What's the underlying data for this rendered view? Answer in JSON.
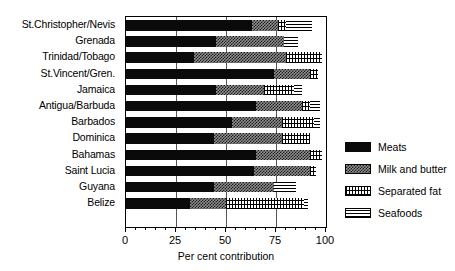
{
  "chart_data": {
    "type": "bar",
    "orientation": "horizontal",
    "stacked": true,
    "title": "",
    "xlabel": "Per cent contribution",
    "ylabel": "",
    "xlim": [
      0,
      100
    ],
    "xticks": [
      0,
      25,
      50,
      75,
      100
    ],
    "xtick_labels": [
      "0",
      "25",
      "50",
      "75",
      "100"
    ],
    "minor_tick_interval": 5,
    "grid": "vertical gridlines at 25, 50, 75",
    "legend_position": "right",
    "categories": [
      "St.Christopher/Nevis",
      "Grenada",
      "Trinidad/Tobago",
      "St.Vincent/Gren.",
      "Jamaica",
      "Antigua/Barbuda",
      "Barbados",
      "Dominica",
      "Bahamas",
      "Saint Lucia",
      "Guyana",
      "Belize"
    ],
    "series": [
      {
        "name": "Meats",
        "fill": "solid-black",
        "color": "#0a0a0a",
        "values": [
          63,
          45,
          34,
          74,
          45,
          65,
          53,
          44,
          65,
          64,
          44,
          32
        ]
      },
      {
        "name": "Milk and butter",
        "fill": "dense-checker",
        "color": "#8f8f8f",
        "values": [
          13,
          34,
          46,
          18,
          24,
          23,
          25,
          34,
          27,
          28,
          30,
          18
        ]
      },
      {
        "name": "Separated fat",
        "fill": "grid-hatch",
        "color": "#ffffff",
        "values": [
          4,
          0,
          18,
          4,
          15,
          4,
          16,
          14,
          6,
          3,
          0,
          39
        ]
      },
      {
        "name": "Seafoods",
        "fill": "horizontal-lines",
        "color": "#ffffff",
        "values": [
          13,
          7,
          0,
          0,
          4,
          5,
          3,
          0,
          0,
          0,
          11,
          2
        ]
      }
    ],
    "totals": [
      93,
      86,
      98,
      96,
      88,
      97,
      97,
      92,
      98,
      95,
      85,
      91
    ],
    "legend_entries": [
      {
        "label": "Meats",
        "fill": "solid-black"
      },
      {
        "label": "Milk and butter",
        "fill": "dense-checker"
      },
      {
        "label": "Separated fat",
        "fill": "grid-hatch"
      },
      {
        "label": "Seafoods",
        "fill": "horizontal-lines"
      }
    ]
  }
}
